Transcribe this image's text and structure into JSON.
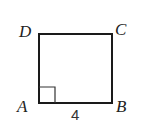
{
  "figure": {
    "shape": "square",
    "stroke_color": "#1a1a1a",
    "background": "#ffffff",
    "vertices": {
      "A": {
        "label": "A",
        "x": 39,
        "y": 103
      },
      "B": {
        "label": "B",
        "x": 112,
        "y": 103
      },
      "C": {
        "label": "C",
        "x": 112,
        "y": 34
      },
      "D": {
        "label": "D",
        "x": 39,
        "y": 34
      }
    },
    "right_angle_marker": {
      "at": "A",
      "size": 16
    },
    "side_labels": [
      {
        "side": "AB",
        "label": "4"
      }
    ]
  }
}
